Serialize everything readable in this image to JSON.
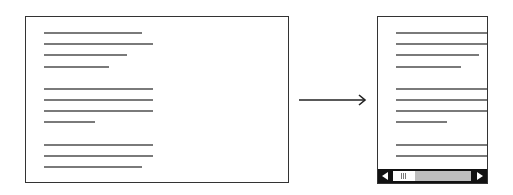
{
  "diagram": {
    "colors": {
      "frame_border": "#333333",
      "text_line": "#7a7a7a",
      "scrollbar_dark": "#111111",
      "scrollbar_track": "#bdbdbd",
      "scrollbar_thumb": "#ffffff",
      "arrow": "#222222"
    },
    "desktop_view": {
      "paragraphs": [
        {
          "line_widths": [
            98,
            109,
            83,
            65
          ]
        },
        {
          "line_widths": [
            109,
            109,
            109,
            51
          ]
        },
        {
          "line_widths": [
            109,
            109,
            98
          ]
        }
      ]
    },
    "arrow": {
      "direction": "right"
    },
    "mobile_view": {
      "paragraphs": [
        {
          "line_widths": [
            98,
            109,
            83,
            65
          ]
        },
        {
          "line_widths": [
            109,
            109,
            109,
            51
          ]
        },
        {
          "line_widths": [
            109,
            109
          ]
        }
      ],
      "scrollbar": {
        "left_button_icon": "triangle-left-icon",
        "right_button_icon": "triangle-right-icon",
        "thumb_position_percent": 0
      }
    }
  }
}
